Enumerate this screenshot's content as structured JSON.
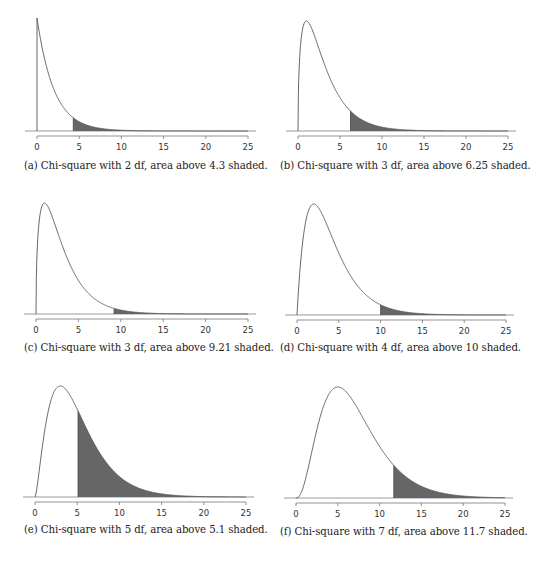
{
  "figure": {
    "panels": [
      {
        "id": "a",
        "caption": "(a) Chi-square with 2 df, area above 4.3 shaded."
      },
      {
        "id": "b",
        "caption": "(b) Chi-square with 3 df, area above 6.25 shaded."
      },
      {
        "id": "c",
        "caption": "(c) Chi-square with 3 df, area above 9.21 shaded."
      },
      {
        "id": "d",
        "caption": "(d) Chi-square with 4 df, area above 10 shaded."
      },
      {
        "id": "e",
        "caption": "(e) Chi-square with 5 df, area above 5.1 shaded."
      },
      {
        "id": "f",
        "caption": "(f) Chi-square with 7 df, area above 11.7 shaded."
      }
    ]
  },
  "colors": {
    "curve": "#555555",
    "shade": "#666666",
    "axis": "#777777",
    "baseline": "#999999"
  },
  "chart_data": [
    {
      "type": "area",
      "title": "(a) Chi-square with 2 df, area above 4.3 shaded.",
      "distribution": "chi-square",
      "df": 2,
      "shaded_above": 4.3,
      "xlabel": "",
      "ylabel": "",
      "xlim": [
        0,
        25
      ],
      "xticks": [
        0,
        5,
        10,
        15,
        20,
        25
      ],
      "grid": false,
      "legend": null
    },
    {
      "type": "area",
      "title": "(b) Chi-square with 3 df, area above 6.25 shaded.",
      "distribution": "chi-square",
      "df": 3,
      "shaded_above": 6.25,
      "xlabel": "",
      "ylabel": "",
      "xlim": [
        0,
        25
      ],
      "xticks": [
        0,
        5,
        10,
        15,
        20,
        25
      ],
      "grid": false,
      "legend": null
    },
    {
      "type": "area",
      "title": "(c) Chi-square with 3 df, area above 9.21 shaded.",
      "distribution": "chi-square",
      "df": 3,
      "shaded_above": 9.21,
      "xlabel": "",
      "ylabel": "",
      "xlim": [
        0,
        25
      ],
      "xticks": [
        0,
        5,
        10,
        15,
        20,
        25
      ],
      "grid": false,
      "legend": null
    },
    {
      "type": "area",
      "title": "(d) Chi-square with 4 df, area above 10 shaded.",
      "distribution": "chi-square",
      "df": 4,
      "shaded_above": 10,
      "xlabel": "",
      "ylabel": "",
      "xlim": [
        0,
        25
      ],
      "xticks": [
        0,
        5,
        10,
        15,
        20,
        25
      ],
      "grid": false,
      "legend": null
    },
    {
      "type": "area",
      "title": "(e) Chi-square with 5 df, area above 5.1 shaded.",
      "distribution": "chi-square",
      "df": 5,
      "shaded_above": 5.1,
      "xlabel": "",
      "ylabel": "",
      "xlim": [
        0,
        25
      ],
      "xticks": [
        0,
        5,
        10,
        15,
        20,
        25
      ],
      "grid": false,
      "legend": null
    },
    {
      "type": "area",
      "title": "(f) Chi-square with 7 df, area above 11.7 shaded.",
      "distribution": "chi-square",
      "df": 7,
      "shaded_above": 11.7,
      "xlabel": "",
      "ylabel": "",
      "xlim": [
        0,
        25
      ],
      "xticks": [
        0,
        5,
        10,
        15,
        20,
        25
      ],
      "grid": false,
      "legend": null
    }
  ]
}
